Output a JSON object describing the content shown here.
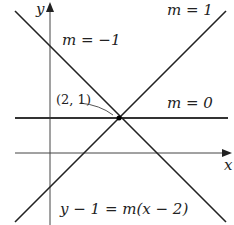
{
  "diagram": {
    "axes": {
      "x_label": "x",
      "y_label": "y"
    },
    "point_label": "(2, 1)",
    "lines": [
      {
        "label": "m = 1",
        "slope": 1
      },
      {
        "label": "m = −1",
        "slope": -1
      },
      {
        "label": "m = 0",
        "slope": 0
      }
    ],
    "equation": "y − 1 = m(x − 2)"
  }
}
